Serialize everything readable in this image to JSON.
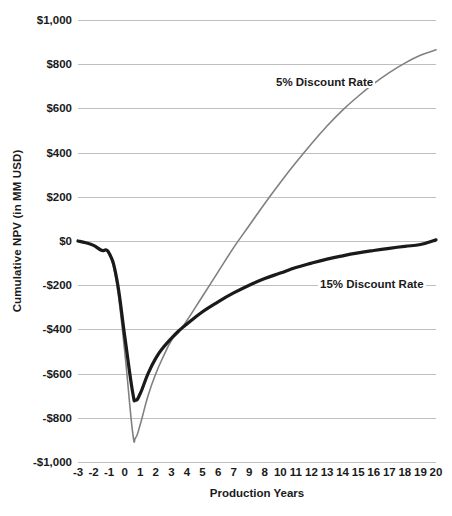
{
  "chart_data": {
    "type": "line",
    "title": "",
    "xlabel": "Production Years",
    "ylabel": "Cumulative NPV (in MM USD)",
    "xlim": [
      -3,
      20
    ],
    "ylim": [
      -1000,
      1000
    ],
    "grid": true,
    "legend_position": "inline-annotations",
    "y_ticks": [
      {
        "value": 1000,
        "label": "$1,000"
      },
      {
        "value": 800,
        "label": "$800"
      },
      {
        "value": 600,
        "label": "$600"
      },
      {
        "value": 400,
        "label": "$400"
      },
      {
        "value": 200,
        "label": "$200"
      },
      {
        "value": 0,
        "label": "$0"
      },
      {
        "value": -200,
        "label": "-$200"
      },
      {
        "value": -400,
        "label": "-$400"
      },
      {
        "value": -600,
        "label": "-$600"
      },
      {
        "value": -800,
        "label": "-$800"
      },
      {
        "value": -1000,
        "label": "-$1,000"
      }
    ],
    "x_tick_labels": [
      "-3",
      "-2",
      "-1",
      "0",
      "1",
      "2",
      "3",
      "4",
      "5",
      "6",
      "7",
      "9",
      "8",
      "10",
      "11",
      "12",
      "13",
      "14",
      "15",
      "16",
      "17",
      "18",
      "19",
      "20"
    ],
    "x_tick_values": [
      -3,
      -2,
      -1,
      0,
      1,
      2,
      3,
      4,
      5,
      6,
      7,
      8,
      9,
      10,
      11,
      12,
      13,
      14,
      15,
      16,
      17,
      18,
      19,
      20
    ],
    "x": [
      -3,
      -2.5,
      -2,
      -1.5,
      -1,
      -0.5,
      0,
      0.5,
      0.7,
      1,
      1.5,
      2,
      2.5,
      3,
      3.5,
      4,
      5,
      6,
      7,
      8,
      9,
      10,
      11,
      12,
      13,
      14,
      15,
      16,
      17,
      18,
      19,
      20
    ],
    "series": [
      {
        "name": "5% Discount Rate",
        "color": "#808080",
        "width": 1.6,
        "annotation": "5% Discount Rate",
        "values": [
          0,
          -8,
          -20,
          -40,
          -60,
          -200,
          -500,
          -860,
          -890,
          -830,
          -700,
          -600,
          -520,
          -450,
          -410,
          -360,
          -250,
          -140,
          -30,
          70,
          170,
          265,
          355,
          440,
          520,
          592,
          655,
          712,
          762,
          805,
          840,
          865
        ]
      },
      {
        "name": "15% Discount Rate",
        "color": "#1a1a1a",
        "width": 3.2,
        "annotation": "15% Discount Rate",
        "values": [
          0,
          -8,
          -20,
          -42,
          -55,
          -175,
          -430,
          -680,
          -720,
          -690,
          -600,
          -530,
          -480,
          -440,
          -405,
          -375,
          -320,
          -275,
          -235,
          -200,
          -170,
          -145,
          -120,
          -100,
          -82,
          -67,
          -54,
          -43,
          -33,
          -24,
          -16,
          5
        ]
      }
    ]
  }
}
